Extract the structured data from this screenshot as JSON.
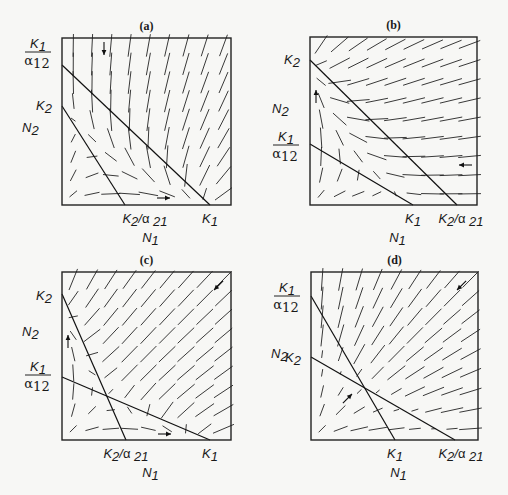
{
  "figure": {
    "axis_x": "N1",
    "axis_y": "N2",
    "panels": [
      {
        "id": "a",
        "title": "(a)",
        "box": [
          62,
          38,
          231,
          205
        ],
        "y_labels": [
          {
            "text": "K1/α12",
            "kind": "fraction",
            "num": "K",
            "num_sub": "1",
            "den": "α",
            "den_sub": "12",
            "y": 52
          },
          {
            "text": "K2",
            "kind": "simple",
            "main": "K",
            "sub": "2",
            "y": 106
          }
        ],
        "x_labels": [
          {
            "text": "K2/α21",
            "kind": "ratio",
            "main": "K",
            "sub": "2",
            "den": "α",
            "den_sub": "21",
            "x": 145
          },
          {
            "text": "K1",
            "kind": "simple",
            "main": "K",
            "sub": "1",
            "x": 210
          }
        ],
        "isoclines": [
          {
            "name": "N1 isocline",
            "from": [
              62,
              65
            ],
            "to": [
              210,
              205
            ]
          },
          {
            "name": "N2 isocline",
            "from": [
              62,
              106
            ],
            "to": [
              125,
              205
            ]
          }
        ],
        "arrows": [
          {
            "dir": "down",
            "x": 104,
            "y": 55
          },
          {
            "dir": "right",
            "x": 170,
            "y": 198
          }
        ],
        "field_type": "a"
      },
      {
        "id": "b",
        "title": "(b)",
        "box": [
          310,
          37,
          477,
          205
        ],
        "y_labels": [
          {
            "text": "K2",
            "kind": "simple",
            "main": "K",
            "sub": "2",
            "y": 60
          },
          {
            "text": "K1/α12",
            "kind": "fraction",
            "num": "K",
            "num_sub": "1",
            "den": "α",
            "den_sub": "12",
            "y": 145
          }
        ],
        "x_labels": [
          {
            "text": "K1",
            "kind": "simple",
            "main": "K",
            "sub": "1",
            "x": 413
          },
          {
            "text": "K2/α21",
            "kind": "ratio",
            "main": "K",
            "sub": "2",
            "den": "α",
            "den_sub": "21",
            "x": 461
          }
        ],
        "isoclines": [
          {
            "name": "N2 isocline",
            "from": [
              310,
              60
            ],
            "to": [
              457,
              205
            ]
          },
          {
            "name": "N1 isocline",
            "from": [
              310,
              144
            ],
            "to": [
              413,
              205
            ]
          }
        ],
        "arrows": [
          {
            "dir": "up",
            "x": 316,
            "y": 90
          },
          {
            "dir": "left",
            "x": 459,
            "y": 165
          }
        ],
        "field_type": "b"
      },
      {
        "id": "c",
        "title": "(c)",
        "box": [
          62,
          272,
          231,
          440
        ],
        "y_labels": [
          {
            "text": "K2",
            "kind": "simple",
            "main": "K",
            "sub": "2",
            "y": 296
          },
          {
            "text": "K1/α12",
            "kind": "fraction",
            "num": "K",
            "num_sub": "1",
            "den": "α",
            "den_sub": "12",
            "y": 375
          }
        ],
        "x_labels": [
          {
            "text": "K2/α21",
            "kind": "ratio",
            "main": "K",
            "sub": "2",
            "den": "α",
            "den_sub": "21",
            "x": 126
          },
          {
            "text": "K1",
            "kind": "simple",
            "main": "K",
            "sub": "1",
            "x": 210
          }
        ],
        "isoclines": [
          {
            "name": "N2 isocline",
            "from": [
              62,
              294
            ],
            "to": [
              126,
              440
            ]
          },
          {
            "name": "N1 isocline",
            "from": [
              62,
              377
            ],
            "to": [
              210,
              440
            ]
          }
        ],
        "arrows": [
          {
            "dir": "up",
            "x": 68,
            "y": 335
          },
          {
            "dir": "right",
            "x": 171,
            "y": 434
          },
          {
            "dir": "down-left",
            "x": 214,
            "y": 290
          }
        ],
        "field_type": "c"
      },
      {
        "id": "d",
        "title": "(d)",
        "box": [
          311,
          272,
          478,
          440
        ],
        "y_labels": [
          {
            "text": "K1/α12",
            "kind": "fraction",
            "num": "K",
            "num_sub": "1",
            "den": "α",
            "den_sub": "12",
            "y": 296
          },
          {
            "text": "K2",
            "kind": "simple",
            "main": "K",
            "sub": "2",
            "y": 358
          }
        ],
        "x_labels": [
          {
            "text": "K1",
            "kind": "simple",
            "main": "K",
            "sub": "1",
            "x": 395
          },
          {
            "text": "K2/α21",
            "kind": "ratio",
            "main": "K",
            "sub": "2",
            "den": "α",
            "den_sub": "21",
            "x": 461
          }
        ],
        "isoclines": [
          {
            "name": "N1 isocline",
            "from": [
              311,
              296
            ],
            "to": [
              395,
              440
            ]
          },
          {
            "name": "N2 isocline",
            "from": [
              311,
              357
            ],
            "to": [
              455,
              440
            ]
          }
        ],
        "arrows": [
          {
            "dir": "up-right",
            "x": 352,
            "y": 394
          },
          {
            "dir": "down-left",
            "x": 457,
            "y": 290
          }
        ],
        "field_type": "d"
      }
    ]
  }
}
